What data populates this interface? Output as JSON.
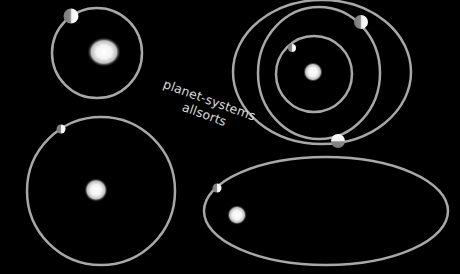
{
  "caption": {
    "line1": "planet-systems",
    "line2": "allsorts"
  },
  "colors": {
    "background": "#000000",
    "orbit": "#a8a8a8",
    "text": "#d8d8d8",
    "sun": "#ffffff"
  },
  "systems": [
    {
      "name": "top-left",
      "orbits": 1,
      "planets": 1
    },
    {
      "name": "top-right",
      "orbits": 3,
      "planets": 3
    },
    {
      "name": "bottom-left",
      "orbits": 1,
      "planets": 1
    },
    {
      "name": "bottom-right-elliptical",
      "orbits": 1,
      "planets": 1
    }
  ]
}
